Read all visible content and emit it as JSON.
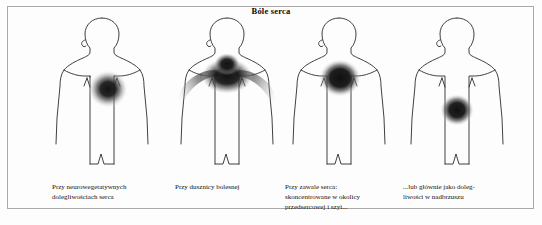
{
  "figure": {
    "title": "Bóle serca",
    "background_color": "#fdfdfd",
    "border_color": "#a9a9a9",
    "pain_color_core": "#161616",
    "pain_color_edge": "#ffffff",
    "outline_color": "#2b2b2b"
  },
  "panels": [
    {
      "id": "neurovegetative",
      "caption": "Przy neurowegetatywnych\ndolegliwościach serca",
      "pain_region": "left-upper-chest",
      "pain_description": "round diffuse blob over left precordium"
    },
    {
      "id": "angina",
      "caption": "Przy dusznicy bolesnej",
      "pain_region": "upper-chest-radiating-both-arms",
      "pain_description": "broad band across sternum radiating into both shoulders and arms"
    },
    {
      "id": "infarction",
      "caption": "Przy zawale serca:\nskoncentrowane w okolicy\nprzedsercowej i szyi...",
      "pain_region": "precordium-and-neck",
      "pain_description": "dense blob high on chest near neck"
    },
    {
      "id": "epigastric",
      "caption": "...lub głównie jako doleg-\nliwości w nadbrzuszu",
      "pain_region": "epigastrium",
      "pain_description": "blob low on torso over upper abdomen"
    }
  ]
}
